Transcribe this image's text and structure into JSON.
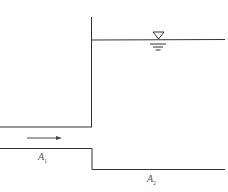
{
  "diagram": {
    "type": "pipe-expansion-to-reservoir",
    "labels": {
      "a1": {
        "base": "A",
        "sub": "1"
      },
      "a2": {
        "base": "A",
        "sub": "2"
      }
    },
    "symbols": [
      "free-surface-triangle",
      "flow-direction-arrow"
    ],
    "colors": {
      "line": "#333333",
      "label": "#555555",
      "background": "#ffffff"
    }
  }
}
